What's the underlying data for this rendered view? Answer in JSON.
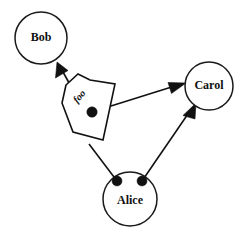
{
  "diagram": {
    "type": "node-link-diagram",
    "background_color": "#ffffff",
    "stroke_color": "#111111",
    "nodes": [
      {
        "id": "bob",
        "label": "Bob",
        "shape": "circle",
        "cx": 41,
        "cy": 38,
        "r": 26
      },
      {
        "id": "carol",
        "label": "Carol",
        "shape": "circle",
        "cx": 209,
        "cy": 86,
        "r": 24
      },
      {
        "id": "alice",
        "label": "Alice",
        "shape": "circle",
        "cx": 130,
        "cy": 199,
        "r": 27
      }
    ],
    "message_object": {
      "id": "foo-message",
      "label": "foo",
      "shape": "pentagon-arrow",
      "label_x": 80,
      "label_y": 97,
      "label_rotation": -48,
      "dot_x": 92,
      "dot_y": 112,
      "dot_r": 5.2
    },
    "ports": [
      {
        "id": "alice-port-left",
        "cx": 117,
        "cy": 181,
        "r": 5.0
      },
      {
        "id": "alice-port-right",
        "cx": 142,
        "cy": 181,
        "r": 5.0
      }
    ],
    "edges": [
      {
        "id": "foo-to-bob",
        "from": "foo-message",
        "to": "bob",
        "arrow": true
      },
      {
        "id": "foo-to-carol",
        "from": "foo-message-dot",
        "to": "carol",
        "arrow": true
      },
      {
        "id": "alice-to-carol",
        "from": "alice-port-right",
        "to": "carol",
        "arrow": true
      },
      {
        "id": "alice-to-foo",
        "from": "alice-port-left",
        "to": "foo-message",
        "arrow": false
      }
    ]
  }
}
